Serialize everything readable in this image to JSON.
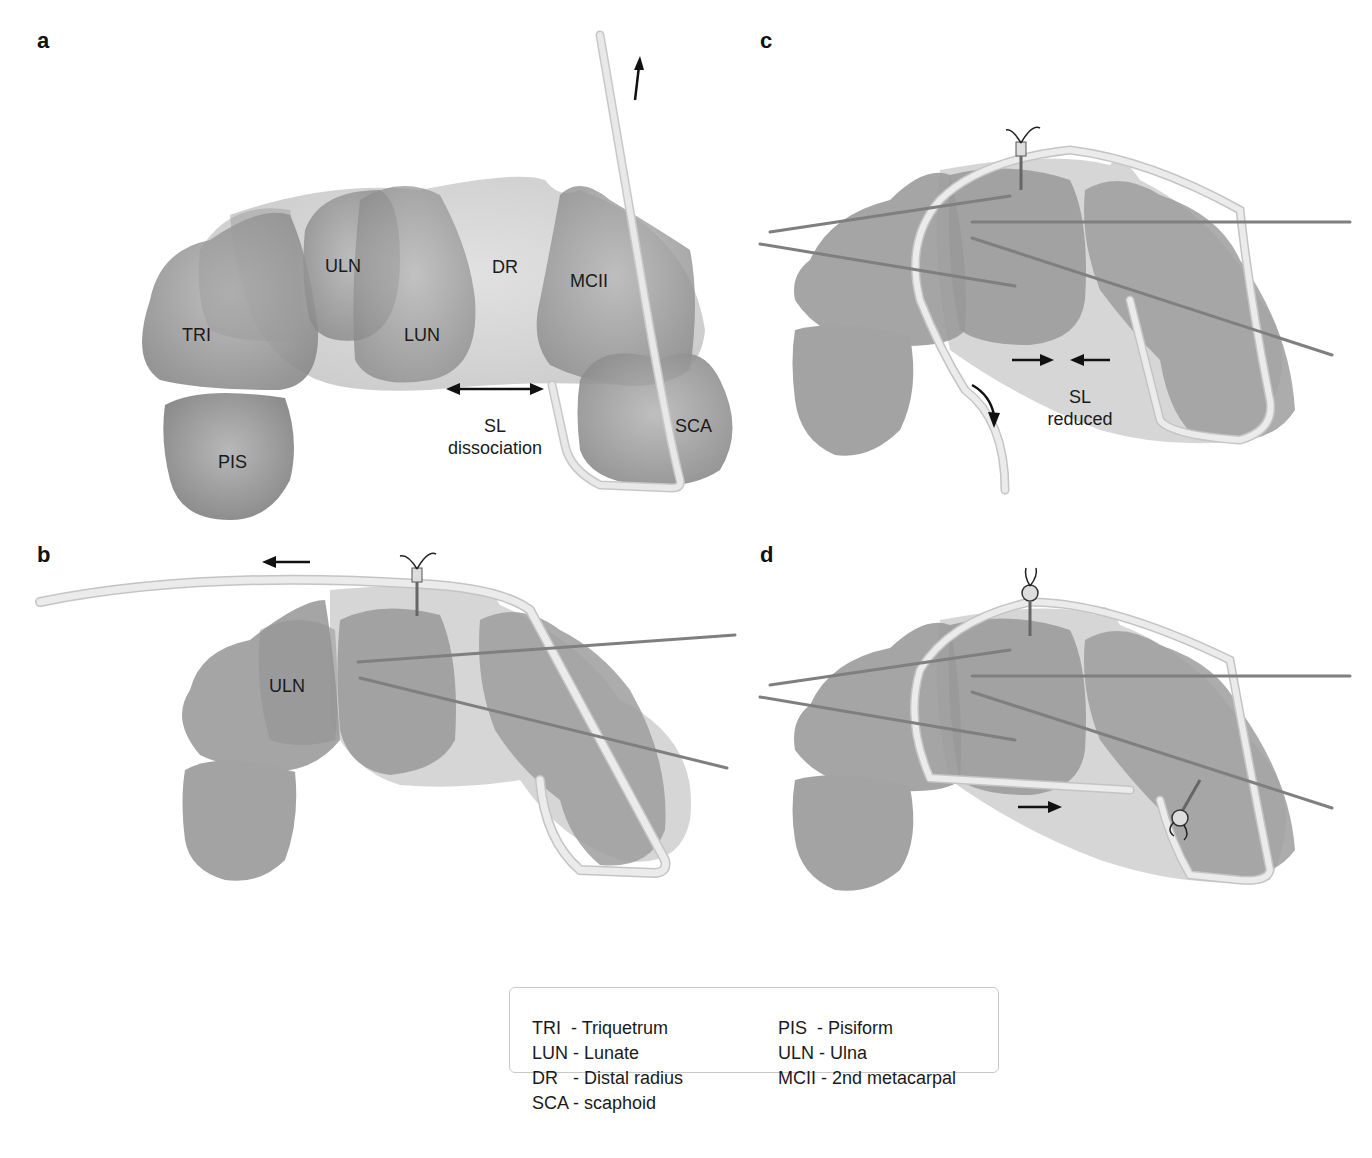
{
  "figure": {
    "panels": [
      {
        "id": "a",
        "letter": "a",
        "bone_labels": {
          "TRI": "TRI",
          "ULN": "ULN",
          "DR": "DR",
          "LUN": "LUN",
          "MCII": "MCII",
          "PIS": "PIS",
          "SCA": "SCA"
        },
        "annotation": {
          "line1": "SL",
          "line2": "dissociation"
        },
        "arrows": [
          "double-headed-horizontal-arrow",
          "up-arrow"
        ]
      },
      {
        "id": "b",
        "letter": "b",
        "bone_labels": {
          "ULN": "ULN"
        },
        "arrows": [
          "left-arrow"
        ]
      },
      {
        "id": "c",
        "letter": "c",
        "annotation": {
          "line1": "SL",
          "line2": "reduced"
        },
        "arrows": [
          "right-arrow",
          "left-arrow",
          "curved-down-arrow"
        ]
      },
      {
        "id": "d",
        "letter": "d",
        "arrows": [
          "right-arrow"
        ]
      }
    ]
  },
  "legend": {
    "left_column": [
      {
        "abbr": "TRI ",
        "sep": " - ",
        "name": "Triquetrum"
      },
      {
        "abbr": "LUN",
        "sep": " - ",
        "name": "Lunate"
      },
      {
        "abbr": "DR  ",
        "sep": " - ",
        "name": "Distal radius"
      },
      {
        "abbr": "SCA",
        "sep": " - ",
        "name": "scaphoid"
      }
    ],
    "right_column": [
      {
        "abbr": "PIS ",
        "sep": " - ",
        "name": "Pisiform"
      },
      {
        "abbr": "ULN",
        "sep": " - ",
        "name": "Ulna"
      },
      {
        "abbr": "MCII",
        "sep": " - ",
        "name": "2nd metacarpal"
      }
    ]
  },
  "colors": {
    "bone_dark": "#8f8f8f",
    "bone_mid": "#a6a6a6",
    "bone_light": "#c9c9c9",
    "graft": "#e4e4e4",
    "graft_outline": "#c2c2c2",
    "kwire": "#8a8a8a",
    "arrow": "#111111"
  }
}
